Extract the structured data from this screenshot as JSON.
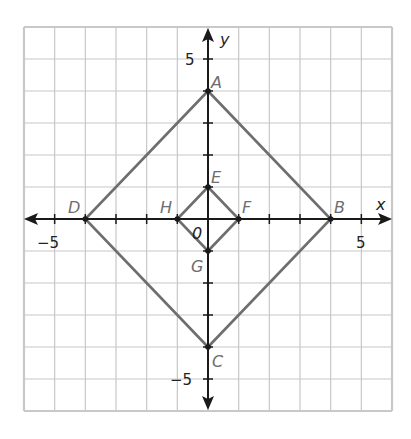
{
  "diagram": {
    "type": "coordinate-plane",
    "axes": {
      "x_label": "x",
      "y_label": "y",
      "x_range": [
        -6,
        6
      ],
      "y_range": [
        -6,
        6
      ],
      "tick_labels": {
        "x_neg": "−5",
        "x_pos": "5",
        "y_pos": "5",
        "y_neg": "−5",
        "origin": "0"
      }
    },
    "points": [
      {
        "name": "A",
        "x": 0,
        "y": 4
      },
      {
        "name": "B",
        "x": 4,
        "y": 0
      },
      {
        "name": "C",
        "x": 0,
        "y": -4
      },
      {
        "name": "D",
        "x": -4,
        "y": 0
      },
      {
        "name": "E",
        "x": 0,
        "y": 1
      },
      {
        "name": "F",
        "x": 1,
        "y": 0
      },
      {
        "name": "G",
        "x": 0,
        "y": -1
      },
      {
        "name": "H",
        "x": -1,
        "y": 0
      }
    ],
    "polygons": [
      {
        "name": "ABCD",
        "vertices": [
          "A",
          "B",
          "C",
          "D"
        ]
      },
      {
        "name": "EFGH",
        "vertices": [
          "E",
          "F",
          "G",
          "H"
        ]
      }
    ],
    "colors": {
      "grid": "#c8c8c8",
      "axes": "#1a1a1a",
      "shape": "#6d6e70",
      "labels": "#6d6e70"
    }
  }
}
